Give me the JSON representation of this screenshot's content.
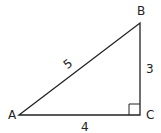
{
  "diagram": {
    "type": "right-triangle",
    "vertices": [
      {
        "id": "A",
        "label": "A",
        "x": 19,
        "y": 115
      },
      {
        "id": "B",
        "label": "B",
        "x": 140,
        "y": 23
      },
      {
        "id": "C",
        "label": "C",
        "x": 140,
        "y": 115
      }
    ],
    "sides": [
      {
        "from": "A",
        "to": "B",
        "label": "5"
      },
      {
        "from": "B",
        "to": "C",
        "label": "3"
      },
      {
        "from": "A",
        "to": "C",
        "label": "4"
      }
    ],
    "right_angle_at": "C",
    "stroke_color": "#222222"
  }
}
